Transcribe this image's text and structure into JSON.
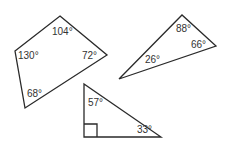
{
  "diagram": {
    "title": "",
    "stroke_color": "#2a2a2a",
    "text_color": "#333333",
    "shapes": [
      {
        "type": "quadrilateral",
        "points": [
          [
            60,
            16
          ],
          [
            107,
            55
          ],
          [
            25,
            108
          ],
          [
            15,
            51
          ]
        ],
        "angles": [
          {
            "label": "104°",
            "x": 52,
            "y": 35
          },
          {
            "label": "72°",
            "x": 82,
            "y": 59
          },
          {
            "label": "68°",
            "x": 27,
            "y": 97
          },
          {
            "label": "130°",
            "x": 18,
            "y": 59
          }
        ]
      },
      {
        "type": "triangle",
        "points": [
          [
            119,
            79
          ],
          [
            182,
            15
          ],
          [
            216,
            46
          ]
        ],
        "angles": [
          {
            "label": "26°",
            "x": 145,
            "y": 63
          },
          {
            "label": "88°",
            "x": 176,
            "y": 32
          },
          {
            "label": "66°",
            "x": 191,
            "y": 48
          }
        ]
      },
      {
        "type": "right-triangle",
        "points": [
          [
            84,
            84
          ],
          [
            84,
            137
          ],
          [
            161,
            137
          ]
        ],
        "right_angle_box": [
          [
            84,
            124
          ],
          [
            97,
            124
          ],
          [
            97,
            137
          ]
        ],
        "angles": [
          {
            "label": "57°",
            "x": 88,
            "y": 106
          },
          {
            "label": "33°",
            "x": 137,
            "y": 133
          }
        ]
      }
    ]
  }
}
